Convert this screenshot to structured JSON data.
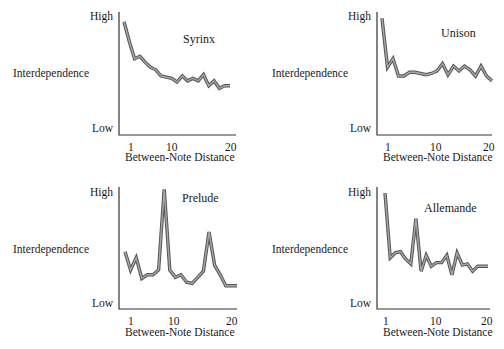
{
  "chart_data": [
    {
      "type": "line",
      "title": "Syrinx",
      "xlabel": "Between-Note Distance",
      "ylabel": "Interdependence",
      "ytick_labels": [
        "Low",
        "High"
      ],
      "xtick_labels": [
        "1",
        "10",
        "20"
      ],
      "x": [
        1,
        2,
        3,
        4,
        5,
        6,
        7,
        8,
        9,
        10,
        11,
        12,
        13,
        14,
        15,
        16,
        17,
        18,
        19,
        20,
        21
      ],
      "values": [
        0.92,
        0.76,
        0.62,
        0.64,
        0.59,
        0.55,
        0.53,
        0.48,
        0.47,
        0.46,
        0.43,
        0.48,
        0.44,
        0.46,
        0.44,
        0.49,
        0.4,
        0.44,
        0.38,
        0.4,
        0.4
      ],
      "ylim": [
        0,
        1
      ],
      "grid": false,
      "legend": "none"
    },
    {
      "type": "line",
      "title": "Unison",
      "xlabel": "Between-Note Distance",
      "ylabel": "Interdependence",
      "ytick_labels": [
        "Low",
        "High"
      ],
      "xtick_labels": [
        "1",
        "10",
        "20"
      ],
      "x": [
        1,
        2,
        3,
        4,
        5,
        6,
        7,
        8,
        9,
        10,
        11,
        12,
        13,
        14,
        15,
        16,
        17,
        18,
        19,
        20,
        21
      ],
      "values": [
        0.95,
        0.55,
        0.62,
        0.48,
        0.48,
        0.51,
        0.51,
        0.5,
        0.49,
        0.5,
        0.52,
        0.58,
        0.49,
        0.56,
        0.52,
        0.56,
        0.53,
        0.48,
        0.56,
        0.48,
        0.44
      ],
      "ylim": [
        0,
        1
      ],
      "grid": false,
      "legend": "none"
    },
    {
      "type": "line",
      "title": "Prelude",
      "xlabel": "Between-Note Distance",
      "ylabel": "Interdependence",
      "ytick_labels": [
        "Low",
        "High"
      ],
      "xtick_labels": [
        "1",
        "10",
        "20"
      ],
      "x": [
        1,
        2,
        3,
        4,
        5,
        6,
        7,
        8,
        9,
        10,
        11,
        12,
        13,
        14,
        15,
        16,
        17,
        18,
        19,
        20,
        21
      ],
      "values": [
        0.47,
        0.32,
        0.42,
        0.25,
        0.28,
        0.28,
        0.32,
        0.98,
        0.32,
        0.26,
        0.28,
        0.22,
        0.21,
        0.26,
        0.31,
        0.63,
        0.36,
        0.28,
        0.19,
        0.19,
        0.19
      ],
      "ylim": [
        0,
        1
      ],
      "grid": false,
      "legend": "none"
    },
    {
      "type": "line",
      "title": "Allemande",
      "xlabel": "Between-Note Distance",
      "ylabel": "Interdependence",
      "ytick_labels": [
        "Low",
        "High"
      ],
      "xtick_labels": [
        "1",
        "10",
        "20"
      ],
      "x": [
        1,
        2,
        3,
        4,
        5,
        6,
        7,
        8,
        9,
        10,
        11,
        12,
        13,
        14,
        15,
        16,
        17,
        18,
        19,
        20,
        21
      ],
      "values": [
        0.95,
        0.42,
        0.46,
        0.47,
        0.41,
        0.37,
        0.74,
        0.31,
        0.44,
        0.35,
        0.38,
        0.38,
        0.44,
        0.28,
        0.46,
        0.36,
        0.37,
        0.31,
        0.35,
        0.35,
        0.35
      ],
      "ylim": [
        0,
        1
      ],
      "grid": false,
      "legend": "none"
    }
  ],
  "panels": [
    {
      "title": "Syrinx",
      "high": "High",
      "low": "Low",
      "ylabel": "Interdependence",
      "xlabel": "Between-Note Distance",
      "t1": "1",
      "t10": "10",
      "t20": "20"
    },
    {
      "title": "Unison",
      "high": "High",
      "low": "Low",
      "ylabel": "Interdependence",
      "xlabel": "Between-Note Distance",
      "t1": "1",
      "t10": "10",
      "t20": "20"
    },
    {
      "title": "Prelude",
      "high": "High",
      "low": "Low",
      "ylabel": "Interdependence",
      "xlabel": "Between-Note Distance",
      "t1": "1",
      "t10": "10",
      "t20": "20"
    },
    {
      "title": "Allemande",
      "high": "High",
      "low": "Low",
      "ylabel": "Interdependence",
      "xlabel": "Between-Note Distance",
      "t1": "1",
      "t10": "10",
      "t20": "20"
    }
  ],
  "colors": {
    "line_outer": "#555555",
    "line_inner": "#a8a8a8",
    "axis": "#333333"
  }
}
